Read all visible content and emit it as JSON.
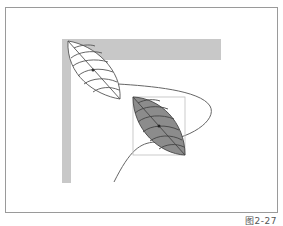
{
  "figure": {
    "caption": "图2-27",
    "colors": {
      "frame": "#9a9a9a",
      "bar": "#c8c8c8",
      "leaf_outline": "#555555",
      "leaf_fill_filled": "#8c8c8c",
      "path": "#666666",
      "bounding_box": "#bdbdbd"
    },
    "elements": {
      "bar": "L-shaped gray bar",
      "leaf_outline": "Outlined leaf with veins (top-left)",
      "leaf_filled": "Filled gray leaf with veins inside bounding box",
      "motion_path": "Curved motion path"
    }
  }
}
